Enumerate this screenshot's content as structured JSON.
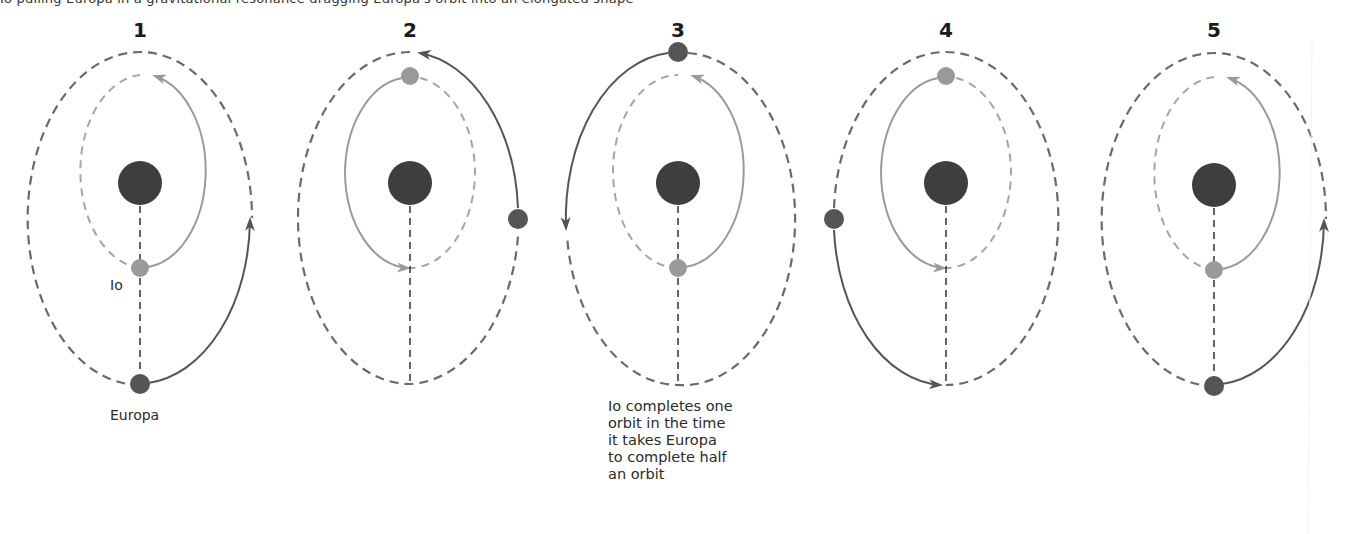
{
  "header": {
    "cut_off_text": "Io pulling Europa in a gravitational resonance dragging Europa's orbit into an elongated shape"
  },
  "colors": {
    "jupiter": "#3e3e3e",
    "europa": "#555555",
    "io": "#9a9a9a",
    "outer_orbit": "#6a6a6a",
    "inner_orbit": "#a5a5a5",
    "axis_line": "#333333",
    "background": "#ffffff"
  },
  "panels": [
    {
      "number": "1",
      "cx": 140,
      "io_pos": "bottom",
      "europa_pos": "bottom",
      "io_label": "Io",
      "europa_label": "Europa"
    },
    {
      "number": "2",
      "cx": 410,
      "io_pos": "top",
      "europa_pos": "right"
    },
    {
      "number": "3",
      "cx": 678,
      "io_pos": "bottom",
      "europa_pos": "top"
    },
    {
      "number": "4",
      "cx": 946,
      "io_pos": "top",
      "europa_pos": "left"
    },
    {
      "number": "5",
      "cx": 1214,
      "io_pos": "bottom",
      "europa_pos": "bottom"
    }
  ],
  "caption": {
    "lines": [
      "Io completes one",
      "orbit in the time",
      "it takes Europa",
      "to complete half",
      "an orbit"
    ]
  }
}
